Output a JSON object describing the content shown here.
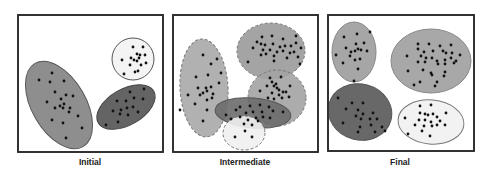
{
  "colors": {
    "frame": "#2a2a2a",
    "point": "#111111",
    "light_gray": "#a9a9a9",
    "mid_gray": "#8f8f8f",
    "dark_gray": "#606060",
    "white_fill": "#f2f2f2"
  },
  "panels": [
    {
      "id": "initial",
      "label": "Initial",
      "frame": {
        "x": 18,
        "y": 15,
        "w": 145,
        "h": 137
      },
      "label_x": 30,
      "clusters": [
        {
          "name": "large-gray-cluster",
          "cx": 59,
          "cy": 105,
          "rx": 27,
          "ry": 48,
          "rot": -30,
          "fill": "#8e8e8e",
          "stroke": "#555",
          "dash": false,
          "points": [
            [
              39,
              80
            ],
            [
              52,
              73
            ],
            [
              64,
              81
            ],
            [
              50,
              82
            ],
            [
              55,
              92
            ],
            [
              66,
              95
            ],
            [
              73,
              96
            ],
            [
              47,
              102
            ],
            [
              61,
              99
            ],
            [
              64,
              104
            ],
            [
              63,
              108
            ],
            [
              60,
              106
            ],
            [
              55,
              108
            ],
            [
              70,
              108
            ],
            [
              69,
              112
            ],
            [
              78,
              116
            ],
            [
              52,
              120
            ],
            [
              63,
              123
            ],
            [
              82,
              128
            ],
            [
              66,
              138
            ]
          ]
        },
        {
          "name": "dark-gray-cluster",
          "cx": 126,
          "cy": 107,
          "rx": 18,
          "ry": 32,
          "rot": 60,
          "fill": "#646464",
          "stroke": "#444",
          "dash": false,
          "points": [
            [
              130,
              92
            ],
            [
              144,
              89
            ],
            [
              117,
              101
            ],
            [
              126,
              101
            ],
            [
              134,
              98
            ],
            [
              143,
              99
            ],
            [
              113,
              111
            ],
            [
              121,
              110
            ],
            [
              127,
              108
            ],
            [
              133,
              107
            ],
            [
              120,
              114
            ],
            [
              128,
              115
            ],
            [
              138,
              112
            ],
            [
              106,
              125
            ],
            [
              118,
              122
            ]
          ]
        },
        {
          "name": "white-cluster",
          "cx": 133,
          "cy": 59,
          "rx": 21,
          "ry": 21,
          "rot": 0,
          "fill": "#f4f4f4",
          "stroke": "#555",
          "dash": false,
          "points": [
            [
              133,
              47
            ],
            [
              143,
              47
            ],
            [
              137,
              54
            ],
            [
              140,
              55
            ],
            [
              139,
              58
            ],
            [
              145,
              55
            ],
            [
              122,
              60
            ],
            [
              134,
              60
            ],
            [
              137,
              61
            ],
            [
              130,
              65
            ],
            [
              141,
              65
            ],
            [
              146,
              63
            ],
            [
              138,
              71
            ],
            [
              124,
              74
            ],
            [
              135,
              72
            ],
            [
              131,
              58
            ]
          ]
        }
      ]
    },
    {
      "id": "intermediate",
      "label": "Intermediate",
      "frame": {
        "x": 173,
        "y": 15,
        "w": 145,
        "h": 137
      },
      "label_x": 185,
      "clusters": [
        {
          "name": "tall-left-cluster",
          "cx": 204,
          "cy": 88,
          "rx": 24,
          "ry": 49,
          "rot": -3,
          "fill": "#a8a8a8",
          "stroke": "#777",
          "dash": true,
          "points": [
            [
              203,
              55
            ],
            [
              217,
              59
            ],
            [
              211,
              64
            ],
            [
              221,
              73
            ],
            [
              196,
              77
            ],
            [
              208,
              75
            ],
            [
              219,
              83
            ],
            [
              198,
              88
            ],
            [
              206,
              88
            ],
            [
              211,
              87
            ],
            [
              207,
              91
            ],
            [
              203,
              93
            ],
            [
              200,
              95
            ],
            [
              213,
              94
            ],
            [
              188,
              95
            ],
            [
              195,
              104
            ],
            [
              207,
              100
            ],
            [
              212,
              98
            ],
            [
              180,
              110
            ],
            [
              207,
              110
            ],
            [
              203,
              121
            ]
          ]
        },
        {
          "name": "top-right-cluster",
          "cx": 271,
          "cy": 51,
          "rx": 34,
          "ry": 28,
          "rot": 0,
          "fill": "#9a9a9a",
          "stroke": "#777",
          "dash": true,
          "points": [
            [
              262,
              37
            ],
            [
              272,
              36
            ],
            [
              283,
              39
            ],
            [
              296,
              36
            ],
            [
              257,
              42
            ],
            [
              261,
              44
            ],
            [
              265,
              45
            ],
            [
              273,
              44
            ],
            [
              280,
              47
            ],
            [
              285,
              46
            ],
            [
              291,
              46
            ],
            [
              296,
              43
            ],
            [
              301,
              48
            ],
            [
              253,
              48
            ],
            [
              263,
              50
            ],
            [
              270,
              50
            ],
            [
              277,
              52
            ],
            [
              283,
              51
            ],
            [
              290,
              53
            ],
            [
              294,
              52
            ],
            [
              261,
              55
            ],
            [
              266,
              54
            ],
            [
              274,
              56
            ],
            [
              287,
              58
            ],
            [
              298,
              57
            ],
            [
              274,
              61
            ],
            [
              248,
              62
            ],
            [
              300,
              64
            ]
          ]
        },
        {
          "name": "mid-right-cluster",
          "cx": 277,
          "cy": 98,
          "rx": 29,
          "ry": 28,
          "rot": 0,
          "fill": "#a3a3a3",
          "stroke": "#777",
          "dash": true,
          "points": [
            [
              270,
              78
            ],
            [
              281,
              77
            ],
            [
              272,
              82
            ],
            [
              276,
              84
            ],
            [
              267,
              86
            ],
            [
              274,
              86
            ],
            [
              277,
              88
            ],
            [
              290,
              86
            ],
            [
              279,
              90
            ],
            [
              283,
              92
            ],
            [
              260,
              91
            ],
            [
              272,
              93
            ],
            [
              279,
              95
            ],
            [
              286,
              92
            ],
            [
              289,
              97
            ],
            [
              268,
              98
            ],
            [
              274,
              99
            ],
            [
              282,
              98
            ]
          ]
        },
        {
          "name": "horizontal-dark-cluster",
          "cx": 253,
          "cy": 113,
          "rx": 38,
          "ry": 15,
          "rot": 5,
          "fill": "#6b6b6b",
          "stroke": "#555",
          "dash": false,
          "points": [
            [
              240,
              107
            ],
            [
              250,
              106
            ],
            [
              260,
              105
            ],
            [
              269,
              107
            ],
            [
              226,
              115
            ],
            [
              236,
              110
            ],
            [
              246,
              113
            ],
            [
              253,
              112
            ],
            [
              262,
              112
            ],
            [
              273,
              111
            ],
            [
              283,
              112
            ],
            [
              231,
              119
            ],
            [
              240,
              117
            ],
            [
              248,
              120
            ],
            [
              256,
              118
            ],
            [
              263,
              117
            ],
            [
              244,
              124
            ],
            [
              252,
              125
            ],
            [
              258,
              121
            ],
            [
              270,
              118
            ]
          ]
        },
        {
          "name": "bottom-white-cluster",
          "cx": 244,
          "cy": 133,
          "rx": 21,
          "ry": 17,
          "rot": 0,
          "fill": "#efefef",
          "stroke": "#777",
          "dash": true,
          "points": [
            [
              235,
              137
            ],
            [
              252,
              137
            ],
            [
              245,
              131
            ]
          ]
        }
      ]
    },
    {
      "id": "final",
      "label": "Final",
      "frame": {
        "x": 328,
        "y": 15,
        "w": 146,
        "h": 136
      },
      "label_x": 340,
      "clusters": [
        {
          "name": "top-left-cluster",
          "cx": 354,
          "cy": 52,
          "rx": 22,
          "ry": 30,
          "rot": 0,
          "fill": "#a6a6a6",
          "stroke": "#888",
          "dash": false,
          "points": [
            [
              344,
              37
            ],
            [
              357,
              34
            ],
            [
              370,
              32
            ],
            [
              346,
              48
            ],
            [
              356,
              44
            ],
            [
              364,
              43
            ],
            [
              351,
              52
            ],
            [
              355,
              51
            ],
            [
              358,
              49
            ],
            [
              361,
              50
            ],
            [
              367,
              51
            ],
            [
              336,
              55
            ],
            [
              350,
              56
            ],
            [
              360,
              59
            ],
            [
              355,
              60
            ],
            [
              343,
              63
            ],
            [
              358,
              69
            ],
            [
              354,
              81
            ]
          ]
        },
        {
          "name": "top-right-cluster",
          "cx": 431,
          "cy": 61,
          "rx": 40,
          "ry": 32,
          "rot": 0,
          "fill": "#a8a8a8",
          "stroke": "#888",
          "dash": false,
          "points": [
            [
              418,
              44
            ],
            [
              429,
              44
            ],
            [
              440,
              46
            ],
            [
              451,
              45
            ],
            [
              418,
              49
            ],
            [
              424,
              52
            ],
            [
              433,
              51
            ],
            [
              443,
              51
            ],
            [
              446,
              53
            ],
            [
              452,
              53
            ],
            [
              460,
              55
            ],
            [
              407,
              56
            ],
            [
              421,
              56
            ],
            [
              426,
              58
            ],
            [
              432,
              58
            ],
            [
              437,
              61
            ],
            [
              445,
              60
            ],
            [
              451,
              58
            ],
            [
              456,
              61
            ],
            [
              418,
              62
            ],
            [
              425,
              62
            ],
            [
              438,
              64
            ],
            [
              445,
              64
            ],
            [
              454,
              63
            ],
            [
              408,
              71
            ],
            [
              423,
              70
            ],
            [
              431,
              73
            ],
            [
              445,
              72
            ],
            [
              432,
              75
            ],
            [
              420,
              82
            ],
            [
              437,
              82
            ],
            [
              444,
              76
            ],
            [
              414,
              85
            ],
            [
              435,
              86
            ]
          ]
        },
        {
          "name": "bottom-left-dark-cluster",
          "cx": 360,
          "cy": 112,
          "rx": 32,
          "ry": 28,
          "rot": 15,
          "fill": "#686868",
          "stroke": "#555",
          "dash": false,
          "points": [
            [
              338,
              98
            ],
            [
              352,
              103
            ],
            [
              363,
              103
            ],
            [
              346,
              109
            ],
            [
              358,
              110
            ],
            [
              363,
              114
            ],
            [
              373,
              113
            ],
            [
              356,
              116
            ],
            [
              361,
              119
            ],
            [
              370,
              119
            ],
            [
              377,
              119
            ],
            [
              343,
              123
            ],
            [
              360,
              127
            ],
            [
              371,
              125
            ],
            [
              382,
              127
            ],
            [
              358,
              132
            ],
            [
              375,
              132
            ],
            [
              385,
              131
            ]
          ]
        },
        {
          "name": "bottom-right-white-cluster",
          "cx": 431,
          "cy": 122,
          "rx": 33,
          "ry": 22,
          "rot": 5,
          "fill": "#f2f2f2",
          "stroke": "#777",
          "dash": false,
          "points": [
            [
              420,
              106
            ],
            [
              431,
              105
            ],
            [
              420,
              113
            ],
            [
              425,
              114
            ],
            [
              428,
              115
            ],
            [
              433,
              114
            ],
            [
              437,
              117
            ],
            [
              446,
              113
            ],
            [
              405,
              118
            ],
            [
              419,
              120
            ],
            [
              425,
              120
            ],
            [
              431,
              122
            ],
            [
              440,
              121
            ],
            [
              415,
              125
            ],
            [
              424,
              126
            ],
            [
              432,
              126
            ],
            [
              437,
              125
            ],
            [
              445,
              125
            ],
            [
              408,
              134
            ],
            [
              422,
              131
            ],
            [
              430,
              136
            ]
          ]
        }
      ]
    }
  ]
}
